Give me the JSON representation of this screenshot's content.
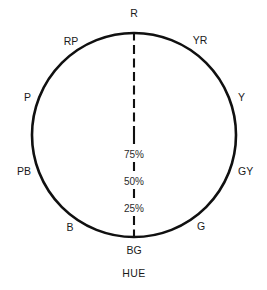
{
  "figure": {
    "caption": "HUE",
    "width": 267,
    "height": 290
  },
  "chart_data": {
    "type": "line",
    "chart_kind": "polar-grid",
    "title": "",
    "subtitle": "",
    "xlabel": "HUE",
    "ylabel": "",
    "grid": true,
    "legend": "none",
    "center": {
      "x": 134,
      "y": 135
    },
    "outer_radius": 102,
    "radial_ticks": [
      {
        "label": "75%",
        "value": 75,
        "radius_fraction": 0.28
      },
      {
        "label": "50%",
        "value": 50,
        "radius_fraction": 0.52
      },
      {
        "label": "25%",
        "value": 25,
        "radius_fraction": 0.76
      }
    ],
    "radial_axis_note": "percent labels decrease outward along the lower vertical axis",
    "categories": [
      "R",
      "YR",
      "Y",
      "GY",
      "G",
      "BG",
      "B",
      "PB",
      "P",
      "RP"
    ],
    "angles_deg": [
      90,
      54,
      18,
      -18,
      -54,
      -90,
      -126,
      -162,
      162,
      126
    ],
    "spokes": [
      {
        "label": "R",
        "angle_deg": 90,
        "label_x": 134,
        "label_y": 17,
        "anchor": "middle",
        "style": "dashed",
        "inner_fraction": 0.0,
        "outer_fraction": 1.0
      },
      {
        "label": "YR",
        "angle_deg": 54,
        "label_x": 200,
        "label_y": 44,
        "anchor": "middle",
        "style": "solid",
        "inner_fraction": 0.0,
        "outer_fraction": 1.0
      },
      {
        "label": "Y",
        "angle_deg": 18,
        "label_x": 238,
        "label_y": 101,
        "anchor": "start",
        "style": "solid",
        "inner_fraction": 0.0,
        "outer_fraction": 1.0
      },
      {
        "label": "GY",
        "angle_deg": -18,
        "label_x": 238,
        "label_y": 175,
        "anchor": "start",
        "style": "solid",
        "inner_fraction": 0.0,
        "outer_fraction": 1.0
      },
      {
        "label": "G",
        "angle_deg": -54,
        "label_x": 201,
        "label_y": 230,
        "anchor": "middle",
        "style": "solid",
        "inner_fraction": 0.0,
        "outer_fraction": 1.0
      },
      {
        "label": "BG",
        "angle_deg": -90,
        "label_x": 134,
        "label_y": 254,
        "anchor": "middle",
        "style": "dashed",
        "inner_fraction": 0.0,
        "outer_fraction": 1.0
      },
      {
        "label": "B",
        "angle_deg": -126,
        "label_x": 70,
        "label_y": 231,
        "anchor": "middle",
        "style": "solid",
        "inner_fraction": 0.0,
        "outer_fraction": 1.0
      },
      {
        "label": "PB",
        "angle_deg": -162,
        "label_x": 31,
        "label_y": 175,
        "anchor": "end",
        "style": "solid",
        "inner_fraction": 0.0,
        "outer_fraction": 1.0
      },
      {
        "label": "P",
        "angle_deg": 162,
        "label_x": 31,
        "label_y": 101,
        "anchor": "end",
        "style": "solid",
        "inner_fraction": 0.0,
        "outer_fraction": 1.0
      },
      {
        "label": "RP",
        "angle_deg": 126,
        "label_x": 71,
        "label_y": 45,
        "anchor": "middle",
        "style": "solid",
        "inner_fraction": 0.0,
        "outer_fraction": 1.0
      }
    ],
    "colors": {
      "outline": "#101010",
      "gridline": "#9a9a9a",
      "text": "#1a1a1a",
      "background": "#ffffff"
    }
  },
  "labels": {
    "hue_r": "R",
    "hue_yr": "YR",
    "hue_y": "Y",
    "hue_gy": "GY",
    "hue_g": "G",
    "hue_bg": "BG",
    "hue_b": "B",
    "hue_pb": "PB",
    "hue_p": "P",
    "hue_rp": "RP",
    "pct_75": "75%",
    "pct_50": "50%",
    "pct_25": "25%",
    "caption": "HUE"
  }
}
